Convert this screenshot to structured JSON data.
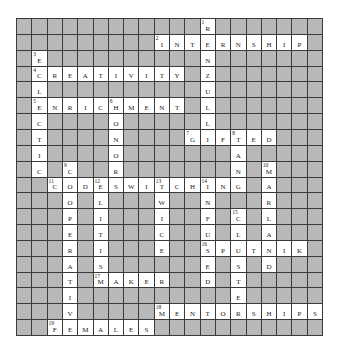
{
  "puzzle": {
    "rows": 20,
    "cols": 20,
    "colors": {
      "block": "#b8b8b8",
      "open": "#ffffff",
      "border": "#3b3b3b",
      "text": "#222222"
    },
    "grid": [
      "############R#######",
      "#########INTERNSHIP#",
      "#E##########N#######",
      "#CREATIVITY#Z#######",
      "#L##########U#######",
      "#ENRICHMENT#L#######",
      "#C####O#####L#######",
      "#T####N####GIFTED###",
      "#I####O#######A#####",
      "#C#C##R#######N#M###",
      "##CODESWITCHING#A###",
      "###O#L###W##N###R###",
      "###P#I###I##F#C#L###",
      "###E#T###C##U#L#A###",
      "###R#I###E##SPUTNIK#",
      "###A#S######E#S#D###",
      "###T#MAKER##D#T#####",
      "###I##########E#####",
      "###V#####MENTORSHIPS",
      "##FEMALES###########"
    ],
    "numbers": [
      {
        "n": "1",
        "row": 0,
        "col": 12
      },
      {
        "n": "2",
        "row": 1,
        "col": 9
      },
      {
        "n": "3",
        "row": 2,
        "col": 1
      },
      {
        "n": "4",
        "row": 3,
        "col": 1
      },
      {
        "n": "5",
        "row": 5,
        "col": 1
      },
      {
        "n": "6",
        "row": 5,
        "col": 6
      },
      {
        "n": "7",
        "row": 7,
        "col": 11
      },
      {
        "n": "8",
        "row": 7,
        "col": 14
      },
      {
        "n": "9",
        "row": 9,
        "col": 3
      },
      {
        "n": "10",
        "row": 9,
        "col": 16
      },
      {
        "n": "11",
        "row": 10,
        "col": 2
      },
      {
        "n": "12",
        "row": 10,
        "col": 5
      },
      {
        "n": "13",
        "row": 10,
        "col": 9
      },
      {
        "n": "14",
        "row": 10,
        "col": 12
      },
      {
        "n": "15",
        "row": 12,
        "col": 14
      },
      {
        "n": "16",
        "row": 14,
        "col": 12
      },
      {
        "n": "17",
        "row": 16,
        "col": 5
      },
      {
        "n": "18",
        "row": 18,
        "col": 9
      },
      {
        "n": "19",
        "row": 19,
        "col": 2
      }
    ],
    "words": {
      "across": [
        {
          "n": "2",
          "answer": "INTERNSHIP"
        },
        {
          "n": "4",
          "answer": "CREATIVITY"
        },
        {
          "n": "5",
          "answer": "ENRICHMENT"
        },
        {
          "n": "7",
          "answer": "GIFTED"
        },
        {
          "n": "11",
          "answer": "CODESWITCHING"
        },
        {
          "n": "16",
          "answer": "SPUTNIK"
        },
        {
          "n": "17",
          "answer": "MAKER"
        },
        {
          "n": "18",
          "answer": "MENTORSHIPS"
        },
        {
          "n": "19",
          "answer": "FEMALES"
        }
      ],
      "down": [
        {
          "n": "1",
          "answer": "RENZULLI"
        },
        {
          "n": "3",
          "answer": "ECLECTIC"
        },
        {
          "n": "6",
          "answer": "HONOR"
        },
        {
          "n": "8",
          "answer": "TANG"
        },
        {
          "n": "9",
          "answer": "COOPERATIVE"
        },
        {
          "n": "10",
          "answer": "MARLAND"
        },
        {
          "n": "12",
          "answer": "ELITISM"
        },
        {
          "n": "13",
          "answer": "TWICE"
        },
        {
          "n": "14",
          "answer": "INFUSED"
        },
        {
          "n": "15",
          "answer": "CLUSTER"
        }
      ]
    }
  }
}
